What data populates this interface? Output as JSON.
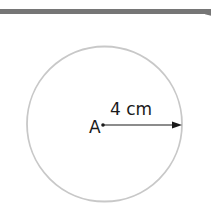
{
  "diagram": {
    "type": "circle-radius",
    "center_label": "A",
    "radius_label": "4 cm",
    "colors": {
      "circle_stroke": "#c8c8c8",
      "arrow": "#1a1a1a",
      "top_rule": "#767676",
      "text": "#1a1a1a"
    }
  }
}
